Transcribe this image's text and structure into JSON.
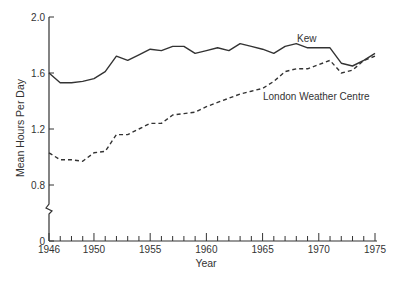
{
  "chart_data": {
    "type": "line",
    "title": "",
    "xlabel": "Year",
    "ylabel": "Mean Hours Per Day",
    "xlim": [
      1946,
      1975
    ],
    "ylim": [
      0,
      2.0
    ],
    "y_axis_break": true,
    "grid": false,
    "x_ticks": [
      1946,
      1950,
      1955,
      1960,
      1965,
      1970,
      1975
    ],
    "x_minor_ticks_every": 1,
    "y_ticks": [
      0,
      0.8,
      1.2,
      1.6,
      2.0
    ],
    "y_tick_labels": [
      "0",
      "0.8",
      "1.2",
      "1.6",
      "2.0"
    ],
    "x": [
      1946,
      1947,
      1948,
      1949,
      1950,
      1951,
      1952,
      1953,
      1954,
      1955,
      1956,
      1957,
      1958,
      1959,
      1960,
      1961,
      1962,
      1963,
      1964,
      1965,
      1966,
      1967,
      1968,
      1969,
      1970,
      1971,
      1972,
      1973,
      1974,
      1975
    ],
    "series": [
      {
        "name": "Kew",
        "style": "solid",
        "color": "#333333",
        "values": [
          1.6,
          1.53,
          1.53,
          1.54,
          1.56,
          1.61,
          1.72,
          1.69,
          1.73,
          1.77,
          1.76,
          1.79,
          1.79,
          1.74,
          1.76,
          1.78,
          1.76,
          1.81,
          1.79,
          1.77,
          1.74,
          1.79,
          1.81,
          1.78,
          1.78,
          1.78,
          1.67,
          1.65,
          1.69,
          1.74
        ]
      },
      {
        "name": "London Weather Centre",
        "style": "dashed",
        "color": "#333333",
        "values": [
          1.03,
          0.98,
          0.98,
          0.97,
          1.03,
          1.04,
          1.16,
          1.16,
          1.2,
          1.24,
          1.24,
          1.3,
          1.31,
          1.32,
          1.36,
          1.39,
          1.42,
          1.45,
          1.47,
          1.49,
          1.54,
          1.61,
          1.63,
          1.63,
          1.66,
          1.69,
          1.6,
          1.62,
          1.69,
          1.72
        ]
      }
    ],
    "annotations": [
      {
        "text": "Kew",
        "series": "Kew",
        "near_x": 1968.5
      },
      {
        "text": "London Weather Centre",
        "series": "London Weather Centre",
        "near_x": 1967
      }
    ]
  }
}
